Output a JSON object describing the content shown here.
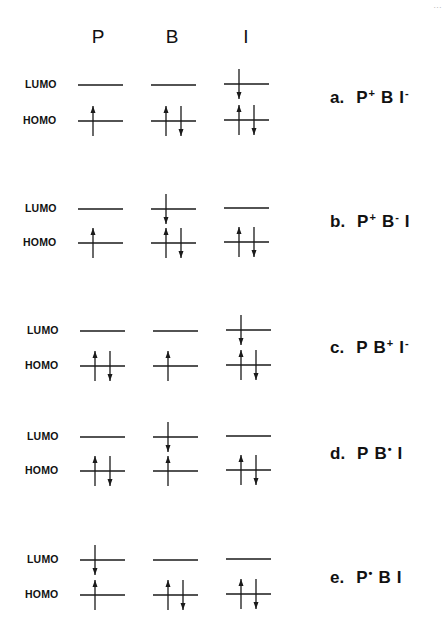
{
  "figure": {
    "corner_text": "…",
    "columns": [
      {
        "key": "P",
        "label": "P",
        "x": 98
      },
      {
        "key": "B",
        "label": "B",
        "x": 172
      },
      {
        "key": "I",
        "label": "I",
        "x": 246
      }
    ],
    "level_labels": {
      "lumo": "LUMO",
      "homo": "HOMO"
    },
    "states": [
      {
        "id": "a",
        "prefix": "a.",
        "label_parts": [
          [
            "P",
            "+"
          ],
          [
            "B",
            ""
          ],
          [
            "I",
            "-"
          ]
        ],
        "lumo_y": 85,
        "homo_y": 121,
        "label_y": 87,
        "P": {
          "lumo": "empty",
          "homo": "up"
        },
        "B": {
          "lumo": "empty",
          "homo": "pair"
        },
        "I": {
          "lumo": "down",
          "homo": "pair"
        }
      },
      {
        "id": "b",
        "prefix": "b.",
        "label_parts": [
          [
            "P",
            "+"
          ],
          [
            "B",
            "-"
          ],
          [
            "I",
            ""
          ]
        ],
        "lumo_y": 209,
        "homo_y": 243,
        "label_y": 211,
        "P": {
          "lumo": "empty",
          "homo": "up"
        },
        "B": {
          "lumo": "down",
          "homo": "pair"
        },
        "I": {
          "lumo": "empty",
          "homo": "pair"
        }
      },
      {
        "id": "c",
        "prefix": "c.",
        "label_parts": [
          [
            "P",
            ""
          ],
          [
            "B",
            "+"
          ],
          [
            "I",
            "-"
          ]
        ],
        "lumo_y": 331,
        "homo_y": 366,
        "label_y": 337,
        "P": {
          "lumo": "empty",
          "homo": "pair"
        },
        "B": {
          "lumo": "empty",
          "homo": "up"
        },
        "I": {
          "lumo": "down",
          "homo": "pair"
        }
      },
      {
        "id": "d",
        "prefix": "d.",
        "label_parts": [
          [
            "P",
            ""
          ],
          [
            "B",
            "•"
          ],
          [
            "I",
            ""
          ]
        ],
        "lumo_y": 437,
        "homo_y": 471,
        "label_y": 443,
        "P": {
          "lumo": "empty",
          "homo": "pair"
        },
        "B": {
          "lumo": "down",
          "homo": "up"
        },
        "I": {
          "lumo": "empty",
          "homo": "pair"
        }
      },
      {
        "id": "e",
        "prefix": "e.",
        "label_parts": [
          [
            "P",
            "•"
          ],
          [
            "B",
            ""
          ],
          [
            "I",
            ""
          ]
        ],
        "lumo_y": 560,
        "homo_y": 595,
        "label_y": 567,
        "P": {
          "lumo": "down",
          "homo": "up"
        },
        "B": {
          "lumo": "empty",
          "homo": "pair"
        },
        "I": {
          "lumo": "empty",
          "homo": "pair"
        }
      }
    ],
    "line_color": "#1a1a1a"
  }
}
